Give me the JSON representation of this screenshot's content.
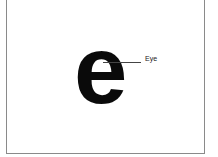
{
  "diagram": {
    "glyph": "e",
    "callouts": [
      {
        "label": "Eye"
      }
    ],
    "colors": {
      "glyph": "#0a0a0a",
      "leader": "#444444",
      "frame": "#8a8a8a",
      "background": "#ffffff"
    }
  }
}
